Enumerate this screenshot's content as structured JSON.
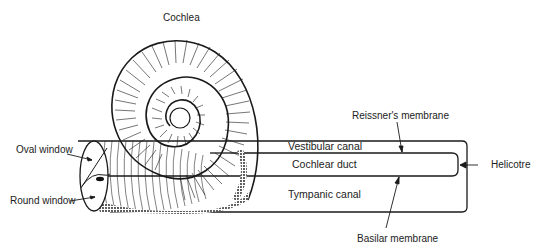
{
  "labels": {
    "cochlea": "Cochlea",
    "oval_window": "Oval window",
    "round_window": "Round window",
    "vestibular_canal": "Vestibular canal",
    "cochlear_duct": "Cochlear duct",
    "tympanic_canal": "Tympanic canal",
    "reissners_membrane": "Reissner's membrane",
    "helicotre": "Helicotre",
    "basilar_membrane": "Basilar membrane"
  },
  "colors": {
    "ink": "#1a1a1a",
    "background": "#ffffff"
  }
}
